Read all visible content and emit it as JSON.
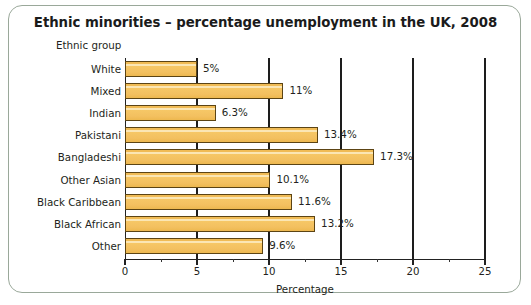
{
  "card": {
    "border_color": "#9aa89a",
    "background": "#ffffff"
  },
  "title": "Ethnic minorities – percentage unemployment in the UK, 2008",
  "category_axis_caption": "Ethnic group",
  "chart_data": {
    "type": "bar",
    "orientation": "horizontal",
    "title": "Ethnic minorities – percentage unemployment in the UK, 2008",
    "xlabel": "Percentage",
    "ylabel": "Ethnic group",
    "xlim": [
      0,
      25
    ],
    "xticks": [
      0,
      5,
      10,
      15,
      20,
      25
    ],
    "xtick_labels": [
      "0",
      "5",
      "10",
      "15",
      "20",
      "25"
    ],
    "minor_tick_interval": 2.5,
    "grid": "vertical",
    "legend": "none",
    "bar_color": "#f5c462",
    "bar_edge_color": "#5c4414",
    "categories": [
      "White",
      "Mixed",
      "Indian",
      "Pakistani",
      "Bangladeshi",
      "Other Asian",
      "Black Caribbean",
      "Black African",
      "Other"
    ],
    "values": [
      5,
      11,
      6.3,
      13.4,
      17.3,
      10.1,
      11.6,
      13.2,
      9.6
    ],
    "data_labels": [
      "5%",
      "11%",
      "6.3%",
      "13.4%",
      "17.3%",
      "10.1%",
      "11.6%",
      "13.2%",
      "9.6%"
    ]
  }
}
